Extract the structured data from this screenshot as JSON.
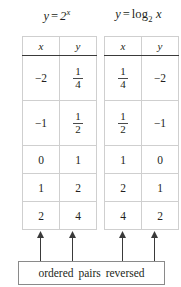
{
  "figure": {
    "background_color": "#ffffff",
    "text_color": "#231f20",
    "border_color": "#bcbcbc",
    "caption": "ordered pairs reversed"
  },
  "left_table": {
    "title": {
      "lhs": "y",
      "equals": "=",
      "base": "2",
      "exponent": "x",
      "full": "y = 2^x"
    },
    "headers": [
      "x",
      "y"
    ],
    "rows": [
      {
        "x": "−2",
        "y_num": "1",
        "y_den": "4",
        "y_is_fraction": true
      },
      {
        "x": "−1",
        "y_num": "1",
        "y_den": "2",
        "y_is_fraction": true
      },
      {
        "x": "0",
        "y": "1",
        "y_is_fraction": false
      },
      {
        "x": "1",
        "y": "2",
        "y_is_fraction": false
      },
      {
        "x": "2",
        "y": "4",
        "y_is_fraction": false
      }
    ]
  },
  "right_table": {
    "title": {
      "lhs": "y",
      "equals": "=",
      "function": "log",
      "base": "2",
      "argument": "x",
      "full": "y = log_2 x"
    },
    "headers": [
      "x",
      "y"
    ],
    "rows": [
      {
        "x_num": "1",
        "x_den": "4",
        "x_is_fraction": true,
        "y": "−2"
      },
      {
        "x_num": "1",
        "x_den": "2",
        "x_is_fraction": true,
        "y": "−1"
      },
      {
        "x": "1",
        "x_is_fraction": false,
        "y": "0"
      },
      {
        "x": "2",
        "x_is_fraction": false,
        "y": "1"
      },
      {
        "x": "4",
        "x_is_fraction": false,
        "y": "2"
      }
    ]
  },
  "arrows": {
    "count": 4,
    "direction": "up",
    "targets": [
      "left-x-column",
      "left-y-column",
      "right-x-column",
      "right-y-column"
    ]
  }
}
